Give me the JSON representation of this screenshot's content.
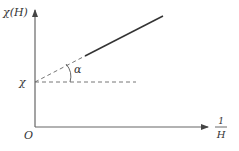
{
  "diagram": {
    "y_axis_label": "χ(H)",
    "x_axis_label_numerator": "1",
    "x_axis_label_denominator": "H",
    "origin_label": "O",
    "intercept_label": "χ",
    "angle_label": "α",
    "colors": {
      "axis": "#555555",
      "line": "#333333",
      "dashed": "#555555",
      "text": "#333333"
    }
  }
}
